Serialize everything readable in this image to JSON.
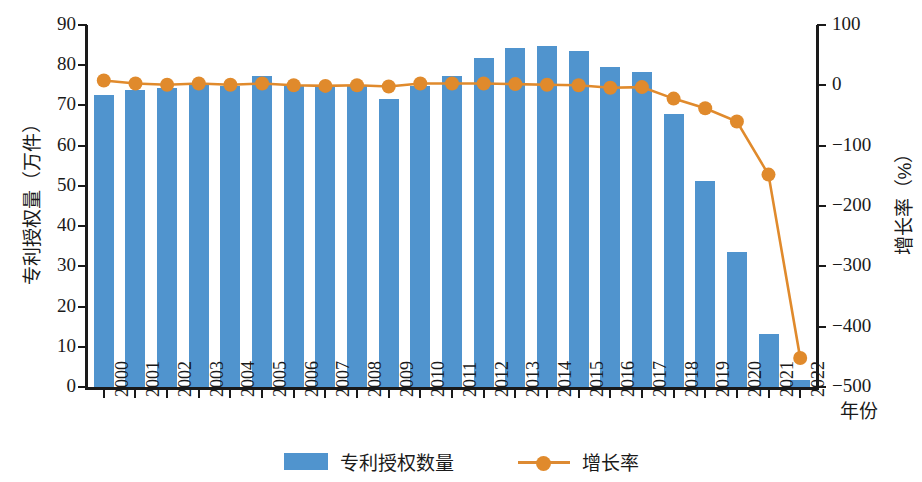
{
  "chart_data": {
    "type": "bar",
    "title": "",
    "xlabel": "年份",
    "categories": [
      "2000",
      "2001",
      "2002",
      "2003",
      "2004",
      "2005",
      "2006",
      "2007",
      "2008",
      "2009",
      "2010",
      "2011",
      "2012",
      "2013",
      "2014",
      "2015",
      "2016",
      "2017",
      "2018",
      "2019",
      "2020",
      "2021",
      "2022"
    ],
    "series": [
      {
        "name": "专利授权数量",
        "type": "bar",
        "axis": "left",
        "unit": "万件",
        "color": "#5094ce",
        "values": [
          72.5,
          73.8,
          74.3,
          75.2,
          74.8,
          77.3,
          74.8,
          74.6,
          74.8,
          71.6,
          74.9,
          77.3,
          81.8,
          84.2,
          84.8,
          83.5,
          79.6,
          78.2,
          68.0,
          51.2,
          33.6,
          13.3,
          1.8
        ]
      },
      {
        "name": "增长率",
        "type": "line",
        "axis": "right",
        "unit": "%",
        "color": "#e08a2c",
        "values": [
          8,
          3,
          1,
          3,
          1,
          3,
          0,
          -1,
          0,
          -2,
          3,
          3,
          3,
          2,
          1,
          0,
          -4,
          -3,
          -22,
          -38,
          -60,
          -148,
          -452
        ]
      }
    ],
    "y_left": {
      "label": "专利授权量（万件）",
      "min": 0,
      "max": 90,
      "step": 10,
      "ticks": [
        "0",
        "10",
        "20",
        "30",
        "40",
        "50",
        "60",
        "70",
        "80",
        "90"
      ]
    },
    "y_right": {
      "label": "增长率（%）",
      "min": -500,
      "max": 100,
      "step": 100,
      "ticks": [
        "100",
        "0",
        "−100",
        "−200",
        "−300",
        "−400",
        "−500"
      ]
    },
    "grid": false,
    "legend_position": "bottom"
  },
  "axes": {
    "left_title": "专利授权量（万件）",
    "right_title": "增长率（%）",
    "x_title": "年份"
  },
  "legend": {
    "bar_label": "专利授权数量",
    "line_label": "增长率"
  }
}
